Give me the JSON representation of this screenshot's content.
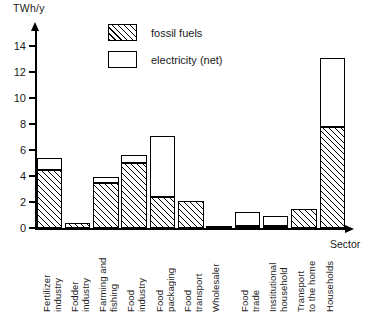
{
  "chart_data": {
    "type": "bar",
    "stacked": true,
    "title": "",
    "subtitle": "",
    "ylabel": "TWh/y",
    "xlabel": "Sector",
    "ylim": [
      0,
      15
    ],
    "yticks": [
      0,
      2,
      4,
      6,
      8,
      10,
      12,
      14
    ],
    "ytick_labels": [
      "0",
      "2",
      "4",
      "6",
      "8",
      "10",
      "12",
      "14"
    ],
    "grid": false,
    "legend_position": "top-center",
    "categories": [
      "Fertilizer\nindustry",
      "Fodder\nindustry",
      "Farming and\nfishing",
      "Food\nindustry",
      "Food\npackaging",
      "Food\ntransport",
      "Wholesaler",
      "Food\ntrade",
      "Institutional\nhousehold",
      "Transport\nto the home",
      "Households"
    ],
    "series": [
      {
        "name": "fossil fuels",
        "fill": "hatched",
        "values": [
          4.5,
          0.35,
          3.5,
          5.0,
          2.4,
          2.1,
          0.1,
          0.15,
          0.15,
          1.5,
          7.8
        ]
      },
      {
        "name": "electricity (net)",
        "fill": "white",
        "values": [
          0.9,
          0.0,
          0.4,
          0.6,
          4.7,
          0.0,
          0.0,
          1.05,
          0.75,
          0.0,
          5.3
        ]
      }
    ],
    "totals": [
      5.4,
      0.35,
      3.9,
      5.6,
      7.1,
      2.1,
      0.1,
      1.2,
      0.9,
      1.5,
      13.1
    ]
  },
  "legend": {
    "items": [
      {
        "label": "fossil fuels",
        "swatch": "hatched-square-icon"
      },
      {
        "label": "electricity (net)",
        "swatch": "empty-square-icon"
      }
    ]
  }
}
